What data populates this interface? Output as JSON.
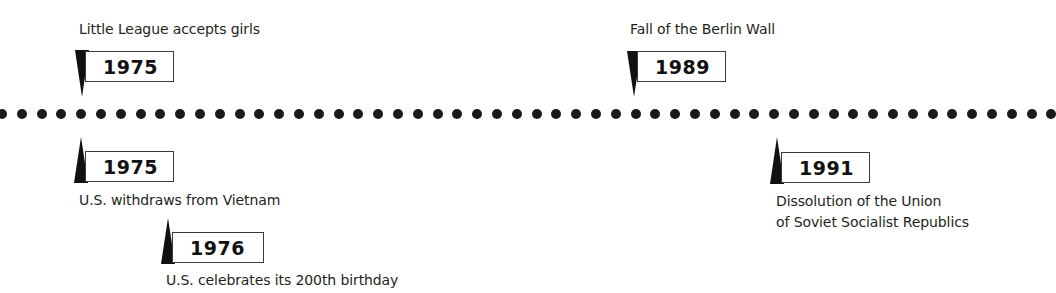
{
  "timeline": {
    "dot_count": 54,
    "dot_spacing_px": 19.8,
    "dot_color": "#1a1a1a",
    "events": [
      {
        "year": "1975",
        "label": "Little League accepts girls",
        "position": "above"
      },
      {
        "year": "1989",
        "label": "Fall of the Berlin Wall",
        "position": "above"
      },
      {
        "year": "1975",
        "label": "U.S. withdraws from Vietnam",
        "position": "below"
      },
      {
        "year": "1976",
        "label": "U.S. celebrates its 200th birthday",
        "position": "below"
      },
      {
        "year": "1991",
        "label_line1": "Dissolution of the Union",
        "label_line2": "of Soviet Socialist Republics",
        "position": "below"
      }
    ]
  }
}
